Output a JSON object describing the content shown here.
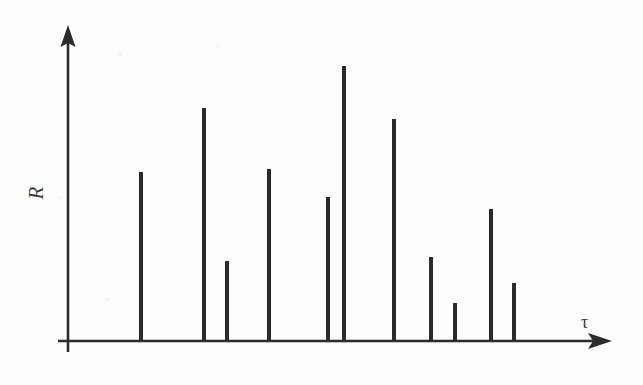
{
  "figure": {
    "background_color": "#fdfdfd",
    "ink_color": "#2b2b2b",
    "width": 643,
    "height": 385
  },
  "axes": {
    "y_label": "R",
    "x_label": "τ",
    "origin_x": 68,
    "baseline_y": 341,
    "y_axis_top": 25,
    "x_axis_right": 612,
    "arrowheads": true,
    "ticks": false,
    "tick_labels": false,
    "grid": false
  },
  "chart_data": {
    "type": "bar",
    "style": "stem-impulse",
    "title": "",
    "subtitle": "",
    "xlabel": "τ",
    "ylabel": "R",
    "grid": false,
    "legend": null,
    "xlim": [
      0,
      643
    ],
    "ylim": [
      0,
      1
    ],
    "axis_units": "arbitrary",
    "note": "Multipath channel impulse response: delay (tau) versus amplitude (R). Values are normalized to the tallest impulse = 1.00; pixel columns/tops read directly off the scan.",
    "categories": [
      "1",
      "2",
      "3",
      "4",
      "5",
      "6",
      "7",
      "8",
      "9",
      "10",
      "11"
    ],
    "values": [
      0.615,
      0.847,
      0.291,
      0.625,
      0.524,
      1.0,
      0.807,
      0.305,
      0.138,
      0.48,
      0.211
    ],
    "pixel_geometry": {
      "bar_width": 4,
      "baseline_y": 341,
      "x_positions": [
        141,
        204,
        227,
        269,
        328,
        344,
        394,
        431,
        455,
        491,
        514
      ],
      "top_y": [
        172,
        108,
        261,
        169,
        197,
        66,
        119,
        257,
        303,
        209,
        283
      ],
      "heights": [
        169,
        233,
        80,
        172,
        144,
        275,
        222,
        84,
        38,
        132,
        58
      ]
    },
    "bars": [
      {
        "id": "impulse-1",
        "x": 141,
        "top": 172,
        "height": 169,
        "value": 0.615
      },
      {
        "id": "impulse-2",
        "x": 204,
        "top": 108,
        "height": 233,
        "value": 0.847
      },
      {
        "id": "impulse-3",
        "x": 227,
        "top": 261,
        "height": 80,
        "value": 0.291
      },
      {
        "id": "impulse-4",
        "x": 269,
        "top": 169,
        "height": 172,
        "value": 0.625
      },
      {
        "id": "impulse-5",
        "x": 328,
        "top": 197,
        "height": 144,
        "value": 0.524
      },
      {
        "id": "impulse-6",
        "x": 344,
        "top": 66,
        "height": 275,
        "value": 1.0
      },
      {
        "id": "impulse-7",
        "x": 394,
        "top": 119,
        "height": 222,
        "value": 0.807
      },
      {
        "id": "impulse-8",
        "x": 431,
        "top": 257,
        "height": 84,
        "value": 0.305
      },
      {
        "id": "impulse-9",
        "x": 455,
        "top": 303,
        "height": 38,
        "value": 0.138
      },
      {
        "id": "impulse-10",
        "x": 491,
        "top": 209,
        "height": 132,
        "value": 0.48
      },
      {
        "id": "impulse-11",
        "x": 514,
        "top": 283,
        "height": 58,
        "value": 0.211
      }
    ]
  }
}
